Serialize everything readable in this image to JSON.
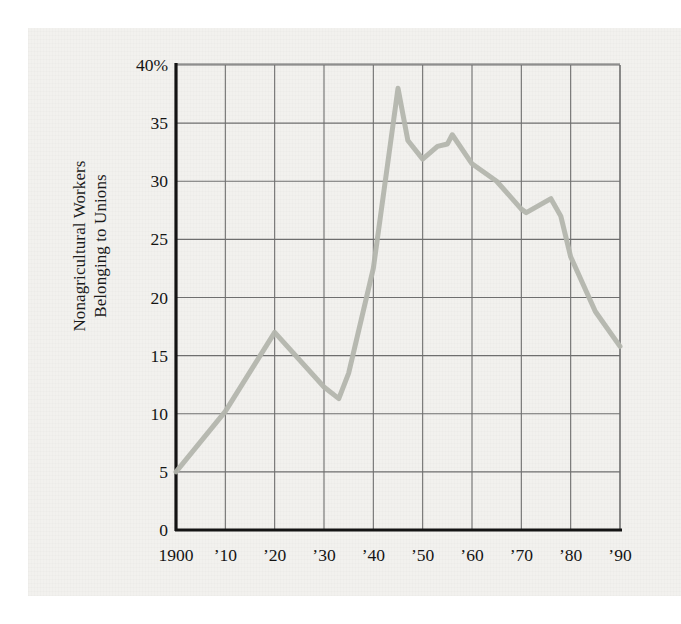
{
  "figure": {
    "background_color": "#f2f1ee",
    "page_background": "#ffffff"
  },
  "axes": {
    "y_title_line1": "Nonagricultural Workers",
    "y_title_line2": "Belonging to Unions",
    "y_tick_labels": [
      "40%",
      "35",
      "30",
      "25",
      "20",
      "15",
      "10",
      "5",
      "0"
    ],
    "x_tick_labels": [
      "1900",
      "’10",
      "’20",
      "’30",
      "’40",
      "’50",
      "’60",
      "’70",
      "’80",
      "’90"
    ]
  },
  "chart_data": {
    "type": "line",
    "title": "",
    "xlabel": "",
    "ylabel": "Nonagricultural Workers Belonging to Unions",
    "xlim": [
      1900,
      1990
    ],
    "ylim": [
      0,
      40
    ],
    "ytick_values": [
      40,
      35,
      30,
      25,
      20,
      15,
      10,
      5,
      0
    ],
    "xtick_values": [
      1900,
      1910,
      1920,
      1930,
      1940,
      1950,
      1960,
      1970,
      1980,
      1990
    ],
    "grid": true,
    "legend": "none",
    "line_color": "#b3b5ad",
    "line_width": 5,
    "axis_color": "#141414",
    "grid_color": "#6e6e6e",
    "x": [
      1900,
      1910,
      1920,
      1930,
      1933,
      1935,
      1940,
      1945,
      1947,
      1950,
      1953,
      1955,
      1956,
      1960,
      1965,
      1970,
      1971,
      1976,
      1978,
      1980,
      1985,
      1990
    ],
    "y": [
      5.0,
      10.2,
      17.0,
      12.3,
      11.3,
      13.5,
      22.5,
      38.0,
      33.5,
      31.9,
      33.0,
      33.2,
      34.0,
      31.5,
      30.0,
      27.6,
      27.3,
      28.5,
      27.0,
      23.5,
      18.8,
      15.8
    ],
    "series": [
      {
        "name": "Union membership share",
        "unit": "percent",
        "points": [
          {
            "year": 1900,
            "value": 5.0
          },
          {
            "year": 1910,
            "value": 10.2
          },
          {
            "year": 1920,
            "value": 17.0
          },
          {
            "year": 1930,
            "value": 12.3
          },
          {
            "year": 1933,
            "value": 11.3
          },
          {
            "year": 1935,
            "value": 13.5
          },
          {
            "year": 1940,
            "value": 22.5
          },
          {
            "year": 1945,
            "value": 38.0
          },
          {
            "year": 1947,
            "value": 33.5
          },
          {
            "year": 1950,
            "value": 31.9
          },
          {
            "year": 1953,
            "value": 33.0
          },
          {
            "year": 1955,
            "value": 33.2
          },
          {
            "year": 1956,
            "value": 34.0
          },
          {
            "year": 1960,
            "value": 31.5
          },
          {
            "year": 1965,
            "value": 30.0
          },
          {
            "year": 1970,
            "value": 27.6
          },
          {
            "year": 1971,
            "value": 27.3
          },
          {
            "year": 1976,
            "value": 28.5
          },
          {
            "year": 1978,
            "value": 27.0
          },
          {
            "year": 1980,
            "value": 23.5
          },
          {
            "year": 1985,
            "value": 18.8
          },
          {
            "year": 1990,
            "value": 15.8
          }
        ]
      }
    ]
  },
  "plot_geometry": {
    "left_px": 176,
    "right_px": 620,
    "top_px": 65,
    "bottom_px": 530
  }
}
